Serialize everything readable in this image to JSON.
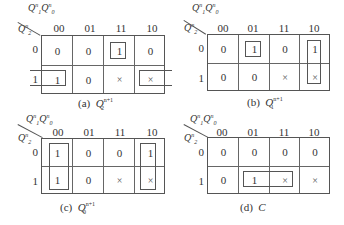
{
  "col_labels": [
    "00",
    "01",
    "11",
    "10"
  ],
  "row_labels": [
    "0",
    "1"
  ],
  "top_var": {
    "a": "Q",
    "a_sup": "n",
    "a_sub": "1",
    "b": "Q",
    "b_sup": "n",
    "b_sub": "0"
  },
  "side_var": {
    "a": "Q",
    "a_sup": "n",
    "a_sub": "2"
  },
  "maps": [
    {
      "id": "a",
      "caption_prefix": "(a)",
      "caption_var": "Q",
      "caption_sub": "2",
      "caption_sup": "n+1",
      "cells": [
        [
          "0",
          "0",
          "1",
          "0"
        ],
        [
          "1",
          "0",
          "×",
          "×"
        ]
      ]
    },
    {
      "id": "b",
      "caption_prefix": "(b)",
      "caption_var": "Q",
      "caption_sub": "1",
      "caption_sup": "n+1",
      "cells": [
        [
          "0",
          "1",
          "0",
          "1"
        ],
        [
          "0",
          "0",
          "×",
          "×"
        ]
      ]
    },
    {
      "id": "c",
      "caption_prefix": "(c)",
      "caption_var": "Q",
      "caption_sub": "0",
      "caption_sup": "n+1",
      "cells": [
        [
          "1",
          "0",
          "0",
          "1"
        ],
        [
          "1",
          "0",
          "×",
          "×"
        ]
      ]
    },
    {
      "id": "d",
      "caption_prefix": "(d)",
      "caption_var": "C",
      "caption_sub": "",
      "caption_sup": "",
      "cells": [
        [
          "0",
          "0",
          "0",
          "0"
        ],
        [
          "0",
          "1",
          "×",
          "×"
        ]
      ]
    }
  ]
}
